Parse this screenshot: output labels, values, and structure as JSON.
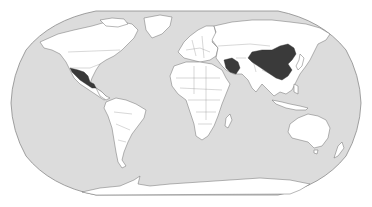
{
  "map": {
    "projection": "Robinson",
    "style": "choropleth",
    "colors": {
      "ocean": "#dcdcdc",
      "land": "#ffffff",
      "highlighted": "#3a3a3a",
      "border": "#6f6f6f",
      "background": "#ffffff"
    },
    "highlighted_countries": [
      "Mexico",
      "Iran",
      "China"
    ],
    "regions": [
      {
        "name": "North America"
      },
      {
        "name": "Greenland"
      },
      {
        "name": "South America"
      },
      {
        "name": "Europe"
      },
      {
        "name": "Africa"
      },
      {
        "name": "Asia"
      },
      {
        "name": "Australia"
      },
      {
        "name": "Antarctica"
      }
    ]
  }
}
